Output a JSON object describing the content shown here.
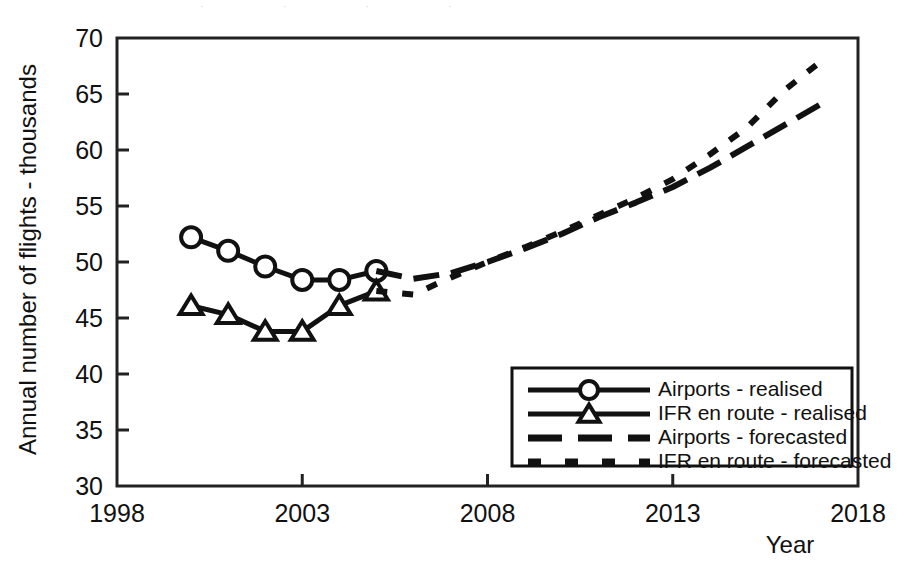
{
  "figure": {
    "top_cut_text": "· · · ·",
    "background_color": "#ffffff",
    "line_color": "#111111",
    "frame_color": "#222222"
  },
  "axes": {
    "y_title": "Annual number of flights - thousands",
    "x_title": "Year",
    "y_ticks": [
      70,
      65,
      60,
      55,
      50,
      45,
      40,
      35,
      30
    ],
    "x_ticks": [
      1998,
      2003,
      2008,
      2013,
      2018
    ],
    "y_min": 30,
    "y_max": 70,
    "x_min": 1998,
    "x_max": 2018
  },
  "legend": {
    "items": [
      {
        "label": "Airports - realised",
        "marker": "circle",
        "style": "solid"
      },
      {
        "label": "IFR en route - realised",
        "marker": "triangle",
        "style": "solid"
      },
      {
        "label": "Airports - forecasted",
        "marker": "none",
        "style": "dashed-long"
      },
      {
        "label": "IFR en route - forecasted",
        "marker": "none",
        "style": "dashed-short"
      }
    ]
  },
  "chart_data": {
    "type": "line",
    "title": "",
    "xlabel": "Year",
    "ylabel": "Annual number of flights - thousands",
    "xlim": [
      1998,
      2018
    ],
    "ylim": [
      30,
      70
    ],
    "grid": false,
    "legend_position": "lower-right",
    "series": [
      {
        "name": "Airports - realised",
        "style": "solid",
        "marker": "circle",
        "x": [
          2000,
          2001,
          2002,
          2003,
          2004,
          2005
        ],
        "values": [
          52.2,
          51.0,
          49.6,
          48.4,
          48.4,
          49.2
        ]
      },
      {
        "name": "IFR en route - realised",
        "style": "solid",
        "marker": "triangle",
        "x": [
          2000,
          2001,
          2002,
          2003,
          2004,
          2005
        ],
        "values": [
          46.1,
          45.3,
          43.8,
          43.8,
          46.1,
          47.4
        ]
      },
      {
        "name": "Airports - forecasted",
        "style": "dashed-long",
        "marker": "none",
        "x": [
          2005,
          2006,
          2007,
          2008,
          2009,
          2010,
          2011,
          2012,
          2013,
          2014,
          2015,
          2016,
          2017
        ],
        "values": [
          49.2,
          48.5,
          49.0,
          50.0,
          51.2,
          52.5,
          54.0,
          55.3,
          56.7,
          58.4,
          60.3,
          62.2,
          64.1
        ]
      },
      {
        "name": "IFR en route - forecasted",
        "style": "dashed-short",
        "marker": "none",
        "x": [
          2005,
          2006,
          2007,
          2008,
          2009,
          2010,
          2011,
          2012,
          2013,
          2014,
          2015,
          2016,
          2017
        ],
        "values": [
          47.4,
          47.1,
          48.6,
          50.0,
          51.3,
          52.7,
          54.2,
          55.7,
          57.4,
          59.6,
          62.0,
          65.3,
          67.9
        ]
      }
    ]
  }
}
